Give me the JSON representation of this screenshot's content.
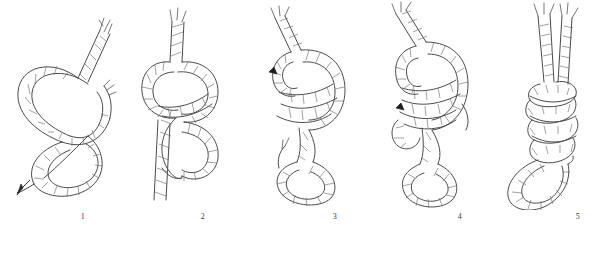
{
  "figure": {
    "background_color": "#ffffff",
    "ink_color": "#4a4a4a",
    "dark_ink_color": "#2b2b2b"
  },
  "steps": [
    {
      "number": "1",
      "name": "figure-eight-loose-with-arrow",
      "x": 83,
      "label_x": 83
    },
    {
      "number": "2",
      "name": "figure-eight-dressed",
      "x": 203,
      "label_x": 203
    },
    {
      "number": "3",
      "name": "loop-pushed-through",
      "x": 335,
      "label_x": 335
    },
    {
      "number": "4",
      "name": "loop-seated",
      "x": 460,
      "label_x": 460
    },
    {
      "number": "5",
      "name": "finished-figure-eight-loop",
      "x": 578,
      "label_x": 578
    }
  ],
  "scale_bracket": {
    "name": "measurement-bracket",
    "left_x": 17,
    "right_x": 221,
    "center_tick_x": 115,
    "top_y": 232,
    "baseline_y": 243,
    "tick_bottom_y": 254,
    "spans_steps": [
      "1",
      "2"
    ]
  },
  "markers": [
    {
      "name": "pull-direction-arrow-step-1",
      "step": "1",
      "direction": "down-left"
    },
    {
      "name": "insertion-point-marker-step-3",
      "step": "3",
      "direction": "left"
    },
    {
      "name": "insertion-point-marker-step-4",
      "step": "4",
      "direction": "left"
    }
  ]
}
